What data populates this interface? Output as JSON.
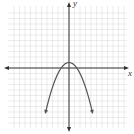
{
  "chart_data": {
    "type": "line",
    "title": "",
    "xlabel": "x",
    "ylabel": "y",
    "xlim": [
      -11,
      11
    ],
    "ylim": [
      -11,
      11
    ],
    "grid": true,
    "legend": null,
    "series": [
      {
        "name": "parabola",
        "equation": "y = -0.5x^2 + 1",
        "vertex": [
          0,
          1
        ],
        "x_intercepts": [
          -1.4,
          1.4
        ],
        "x": [
          -4.2,
          -3,
          -2,
          -1,
          0,
          1,
          2,
          3,
          4.2
        ],
        "y": [
          -7.8,
          -3.5,
          -1,
          0.5,
          1,
          0.5,
          -1,
          -3.5,
          -7.8
        ],
        "arrows_at_ends": true
      }
    ]
  },
  "axes": {
    "x_label": "x",
    "y_label": "y"
  },
  "colors": {
    "grid": "#dddddd",
    "axis": "#333333",
    "curve": "#555555",
    "background": "#ffffff"
  }
}
